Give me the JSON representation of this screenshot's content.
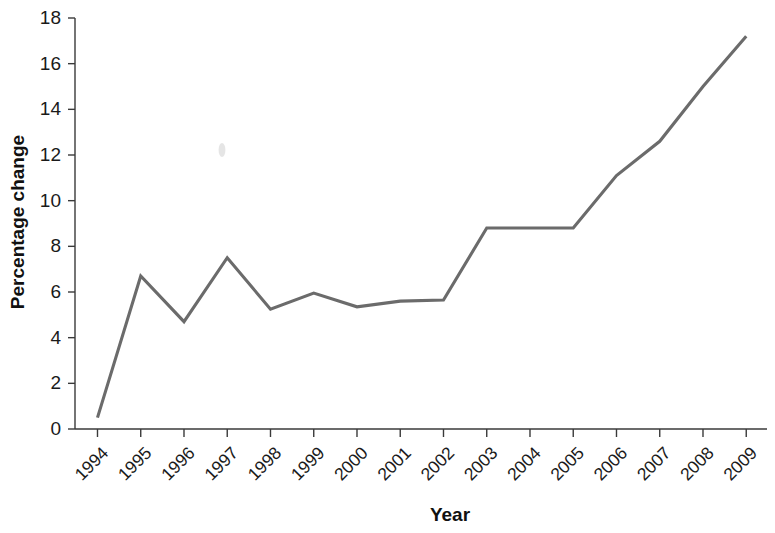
{
  "chart_data": {
    "type": "line",
    "title": "",
    "xlabel": "Year",
    "ylabel": "Percentage change",
    "categories": [
      "1994",
      "1995",
      "1996",
      "1997",
      "1998",
      "1999",
      "2000",
      "2001",
      "2002",
      "2003",
      "2004",
      "2005",
      "2006",
      "2007",
      "2008",
      "2009"
    ],
    "values": [
      0.5,
      6.7,
      4.7,
      7.5,
      5.25,
      5.95,
      5.35,
      5.6,
      5.65,
      8.8,
      8.8,
      8.8,
      11.1,
      12.6,
      15.0,
      17.2
    ],
    "series": [
      {
        "name": "Percentage change",
        "values": [
          0.5,
          6.7,
          4.7,
          7.5,
          5.25,
          5.95,
          5.35,
          5.6,
          5.65,
          8.8,
          8.8,
          8.8,
          11.1,
          12.6,
          15.0,
          17.2
        ],
        "color": "#6b6b6b"
      }
    ],
    "ylim": [
      0,
      18
    ],
    "yticks": [
      0,
      2,
      4,
      6,
      8,
      10,
      12,
      14,
      16,
      18
    ],
    "ytick_labels": [
      "0",
      "2",
      "4",
      "6",
      "8",
      "10",
      "12",
      "14",
      "16",
      "18"
    ],
    "xtick_labels": [
      "1994",
      "1995",
      "1996",
      "1997",
      "1998",
      "1999",
      "2000",
      "2001",
      "2002",
      "2003",
      "2004",
      "2005",
      "2006",
      "2007",
      "2008",
      "2009"
    ],
    "xtick_rotation_degrees": -45,
    "grid": false,
    "legend": false,
    "legend_position": "none",
    "line_color": "#6b6b6b",
    "axis_color": "#3a3a3a",
    "background_color": "#ffffff"
  },
  "artifacts": {
    "smudge_label": "scan-artifact"
  }
}
